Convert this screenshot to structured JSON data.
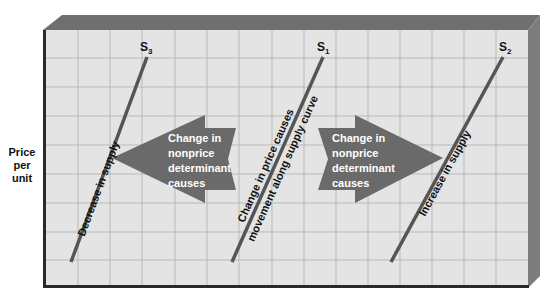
{
  "figure": {
    "y_axis_label_lines": [
      "Price",
      "per",
      "unit"
    ],
    "colors": {
      "background": "#ffffff",
      "grid_fill": "#e4e4e4",
      "grid_lines": "#b9b9b9",
      "frame_top": "#6f6f6f",
      "frame_right": "#7a7a7a",
      "frame_edge": "#2a2a2a",
      "curve": "#555555",
      "arrow": "#6a6a6a",
      "arrow_text": "#ffffff",
      "label_text": "#111111"
    },
    "curves": [
      {
        "id": "S3",
        "label_main": "S",
        "label_sub": "3",
        "from": [
          71,
          262
        ],
        "to": [
          147,
          57
        ],
        "annotation": "Decrease in supply"
      },
      {
        "id": "S1",
        "label_main": "S",
        "label_sub": "1",
        "from": [
          232,
          262
        ],
        "to": [
          323,
          57
        ],
        "annotation_left": "Change in price causes",
        "annotation_right": "movement along supply curve"
      },
      {
        "id": "S2",
        "label_main": "S",
        "label_sub": "2",
        "from": [
          391,
          262
        ],
        "to": [
          503,
          57
        ],
        "annotation": "Increase in supply"
      }
    ],
    "arrows": [
      {
        "direction": "left",
        "text_lines": [
          "Change in",
          "nonprice",
          "determinant",
          "causes"
        ]
      },
      {
        "direction": "right",
        "text_lines": [
          "Change in",
          "nonprice",
          "determinant",
          "causes"
        ]
      }
    ]
  }
}
